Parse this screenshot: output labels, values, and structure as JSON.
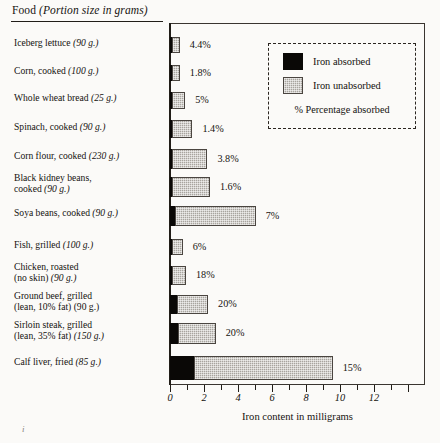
{
  "header": {
    "title_main": "Food ",
    "title_em": "(Portion size in grams)"
  },
  "legend": {
    "absorbed_label": "Iron absorbed",
    "unabsorbed_label": "Iron unabsorbed",
    "note": "% Percentage absorbed",
    "absorbed_color": "#0a0806",
    "unabsorbed_color": "#a8a49e"
  },
  "axis": {
    "x_title": "Iron content in milligrams",
    "tick_labels": [
      "0",
      "2",
      "4",
      "6",
      "8",
      "10",
      "12"
    ]
  },
  "corner_mark": "i",
  "chart_data": {
    "type": "bar",
    "orientation": "horizontal",
    "stacked": true,
    "title": "Food (Portion size in grams)",
    "xlabel": "Iron content in milligrams",
    "ylabel": "",
    "xlim": [
      0,
      15
    ],
    "xticks": [
      0,
      2,
      4,
      6,
      8,
      10,
      12
    ],
    "minor_tick_step": 1,
    "grid": false,
    "legend_position": "top-right",
    "series": [
      {
        "name": "Iron absorbed",
        "color": "#0a0806",
        "values": [
          0.022,
          0.009,
          0.0425,
          0.0175,
          0.0836,
          0.0368,
          0.357,
          0.042,
          0.18,
          0.46,
          0.55,
          1.445
        ]
      },
      {
        "name": "Iron unabsorbed",
        "color": "#a8a49e",
        "values": [
          0.478,
          0.491,
          0.8075,
          1.2325,
          2.1164,
          2.2632,
          4.743,
          0.658,
          0.82,
          1.84,
          2.2,
          8.188
        ]
      }
    ],
    "categories": [
      "Iceberg lettuce (90 g.)",
      "Corn, cooked (100 g.)",
      "Whole wheat bread (25 g.)",
      "Spinach, cooked (90 g.)",
      "Corn flour, cooked (230 g.)",
      "Black kidney beans, cooked (90 g.)",
      "Soya beans, cooked (90 g.)",
      "Fish, grilled (100 g.)",
      "Chicken, roasted (no skin) (90 g.)",
      "Ground beef, grilled (lean, 10% fat) (90 g.)",
      "Sirloin steak, grilled (lean, 35% fat) (150 g.)",
      "Calf liver, fried (85 g.)"
    ],
    "totals": [
      0.5,
      0.5,
      0.85,
      1.25,
      2.2,
      2.3,
      5.1,
      0.7,
      1.0,
      2.3,
      2.75,
      9.633
    ],
    "percent_absorbed": [
      "4.4%",
      "1.8%",
      "5%",
      "1.4%",
      "3.8%",
      "1.6%",
      "7%",
      "6%",
      "18%",
      "20%",
      "20%",
      "15%"
    ]
  },
  "rows": [
    {
      "name_plain": "Iceberg lettuce ",
      "name_em": "(90 g.)",
      "line2_plain": "",
      "line2_em": "",
      "pct": "4.4%"
    },
    {
      "name_plain": "Corn, cooked ",
      "name_em": "(100 g.)",
      "line2_plain": "",
      "line2_em": "",
      "pct": "1.8%"
    },
    {
      "name_plain": "Whole wheat bread ",
      "name_em": "(25 g.)",
      "line2_plain": "",
      "line2_em": "",
      "pct": "5%"
    },
    {
      "name_plain": "Spinach, cooked ",
      "name_em": "(90 g.)",
      "line2_plain": "",
      "line2_em": "",
      "pct": "1.4%"
    },
    {
      "name_plain": "Corn flour, cooked ",
      "name_em": "(230 g.)",
      "line2_plain": "",
      "line2_em": "",
      "pct": "3.8%"
    },
    {
      "name_plain": "Black kidney beans,",
      "name_em": "",
      "line2_plain": "cooked ",
      "line2_em": "(90 g.)",
      "pct": "1.6%"
    },
    {
      "name_plain": "Soya beans, cooked ",
      "name_em": "(90 g.)",
      "line2_plain": "",
      "line2_em": "",
      "pct": "7%"
    },
    {
      "name_plain": "Fish, grilled ",
      "name_em": "(100 g.)",
      "line2_plain": "",
      "line2_em": "",
      "pct": "6%"
    },
    {
      "name_plain": "Chicken, roasted",
      "name_em": "",
      "line2_plain": "(no skin) ",
      "line2_em": "(90 g.)",
      "pct": "18%"
    },
    {
      "name_plain": "Ground beef, grilled",
      "name_em": "",
      "line2_plain": "(lean, 10% fat) (90 g.)",
      "line2_em": "",
      "pct": "20%"
    },
    {
      "name_plain": "Sirloin steak, grilled",
      "name_em": "",
      "line2_plain": "(lean, 35% fat) ",
      "line2_em": "(150 g.)",
      "pct": "20%"
    },
    {
      "name_plain": "Calf liver, fried ",
      "name_em": "(85 g.)",
      "line2_plain": "",
      "line2_em": "",
      "pct": "15%"
    }
  ]
}
